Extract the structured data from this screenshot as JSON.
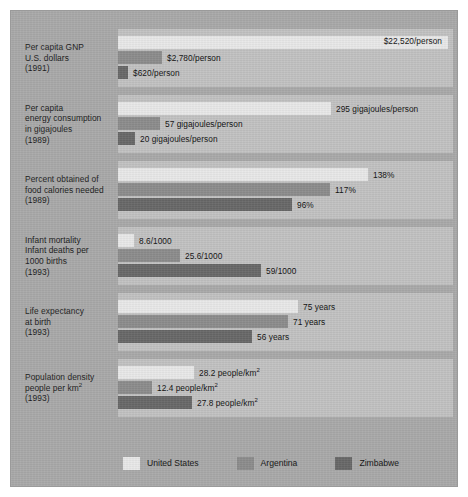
{
  "chart_data": {
    "type": "bar",
    "orientation": "horizontal",
    "title": "",
    "xlabel": "",
    "ylabel": "",
    "grid": false,
    "legend_position": "bottom",
    "series": [
      {
        "name": "United States",
        "color": "#e9e9e9"
      },
      {
        "name": "Argentina",
        "color": "#8c8c8c"
      },
      {
        "name": "Zimbabwe",
        "color": "#686868"
      }
    ],
    "groups": [
      {
        "id": "per-capita-gnp",
        "label_lines": [
          "Per capita GNP",
          "U.S. dollars",
          "(1991)"
        ],
        "unit": "U.S. dollars per person",
        "year": "1991",
        "values": [
          22520,
          2780,
          620
        ],
        "value_labels": [
          "$22,520/person",
          "$2,780/person",
          "$620/person"
        ],
        "bar_widths_px": [
          330,
          44,
          10
        ],
        "label_inside": [
          true,
          false,
          false
        ]
      },
      {
        "id": "per-capita-energy-consumption",
        "label_lines": [
          "Per capita",
          "energy consumption",
          "in gigajoules",
          "(1989)"
        ],
        "unit": "gigajoules per person",
        "year": "1989",
        "values": [
          295,
          57,
          20
        ],
        "value_labels": [
          "295 gigajoules/person",
          "57 gigajoules/person",
          "20 gigajoules/person"
        ],
        "bar_widths_px": [
          213,
          42,
          17
        ],
        "label_inside": [
          false,
          false,
          false
        ]
      },
      {
        "id": "percent-food-calories-needed",
        "label_lines": [
          "Percent obtained of",
          "food calories needed",
          "(1989)"
        ],
        "unit": "percent of food calories needed",
        "year": "1989",
        "values": [
          138,
          117,
          96
        ],
        "value_labels": [
          "138%",
          "117%",
          "96%"
        ],
        "bar_widths_px": [
          250,
          212,
          174
        ],
        "label_inside": [
          false,
          false,
          false
        ]
      },
      {
        "id": "infant-mortality",
        "label_lines": [
          "Infant mortality",
          "Infant deaths per",
          "1000 births",
          "(1993)"
        ],
        "unit": "infant deaths per 1000 births",
        "year": "1993",
        "values": [
          8.6,
          25.6,
          59
        ],
        "value_labels": [
          "8.6/1000",
          "25.6/1000",
          "59/1000"
        ],
        "bar_widths_px": [
          16,
          62,
          143
        ],
        "label_inside": [
          false,
          false,
          false
        ]
      },
      {
        "id": "life-expectancy",
        "label_lines": [
          "Life expectancy",
          "at birth",
          "(1993)"
        ],
        "unit": "years",
        "year": "1993",
        "values": [
          75,
          71,
          56
        ],
        "value_labels": [
          "75 years",
          "71 years",
          "56 years"
        ],
        "bar_widths_px": [
          180,
          170,
          134
        ],
        "label_inside": [
          false,
          false,
          false
        ]
      },
      {
        "id": "population-density",
        "label_lines": [
          "Population density",
          "people per km²",
          "(1993)"
        ],
        "unit": "people per km²",
        "year": "1993",
        "values": [
          28.2,
          12.4,
          27.8
        ],
        "value_labels": [
          "28.2 people/km²",
          "12.4 people/km²",
          "27.8 people/km²"
        ],
        "bar_widths_px": [
          76,
          34,
          74
        ],
        "label_inside": [
          false,
          false,
          false
        ]
      }
    ]
  },
  "legend": {
    "items": [
      {
        "label": "United States",
        "key": "us"
      },
      {
        "label": "Argentina",
        "key": "ar"
      },
      {
        "label": "Zimbabwe",
        "key": "zw"
      }
    ]
  },
  "colors": {
    "frame_background": "#a9a9a9",
    "plot_background": "#c2c2c2",
    "united_states": "#e9e9e9",
    "argentina": "#8c8c8c",
    "zimbabwe": "#686868",
    "text": "#101010"
  }
}
